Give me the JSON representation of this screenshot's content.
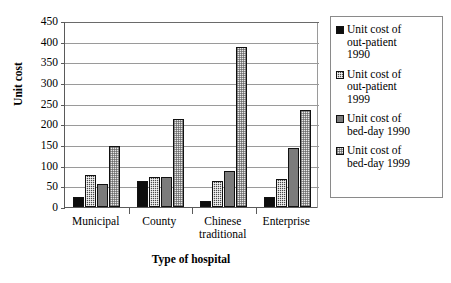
{
  "chart_data": {
    "type": "bar",
    "title": "",
    "xlabel": "Type of hospital",
    "ylabel": "Unit cost",
    "categories": [
      "Municipal",
      "County",
      "Chinese traditional",
      "Enterprise"
    ],
    "series": [
      {
        "name": "Unit cost of out-patient 1990",
        "values": [
          25,
          63,
          15,
          25
        ],
        "swatch": "solid-black"
      },
      {
        "name": "Unit cost of out-patient 1999",
        "values": [
          77,
          72,
          63,
          68
        ],
        "swatch": "dark-checker"
      },
      {
        "name": "Unit cost of bed-day 1990",
        "values": [
          55,
          72,
          87,
          143
        ],
        "swatch": "medium-gray"
      },
      {
        "name": "Unit cost of bed-day 1999",
        "values": [
          148,
          213,
          387,
          235
        ],
        "swatch": "light-dotted"
      }
    ],
    "ylim": [
      0,
      450
    ],
    "yticks": [
      0,
      50,
      100,
      150,
      200,
      250,
      300,
      350,
      400,
      450
    ],
    "grid": true,
    "legend_position": "right"
  },
  "legend": {
    "items": [
      {
        "label_lines": [
          "Unit cost of",
          "out-patient",
          "1990"
        ]
      },
      {
        "label_lines": [
          "Unit cost of",
          "out-patient",
          "1999"
        ]
      },
      {
        "label_lines": [
          "Unit cost of",
          "bed-day 1990"
        ]
      },
      {
        "label_lines": [
          "Unit cost of",
          "bed-day 1999"
        ]
      }
    ]
  },
  "colors": {
    "series_1": "#0d0d0d",
    "series_2": "#4a4a4a",
    "series_3": "#7b7b7b",
    "series_4": "#e9e9e9",
    "axis": "#5a5a5a",
    "grid": "#9a9a9a",
    "background": "#ffffff"
  }
}
